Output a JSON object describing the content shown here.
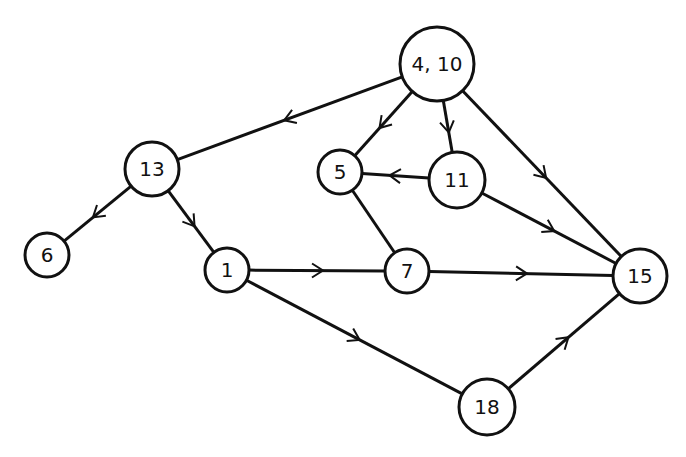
{
  "diagram": {
    "type": "directed-graph",
    "stroke_color": "#111111",
    "background": "#ffffff",
    "nodes": [
      {
        "id": "n4_10",
        "label": "4, 10",
        "x": 437,
        "y": 64,
        "r": 37
      },
      {
        "id": "n13",
        "label": "13",
        "x": 152,
        "y": 169,
        "r": 27
      },
      {
        "id": "n5",
        "label": "5",
        "x": 340,
        "y": 172,
        "r": 22
      },
      {
        "id": "n11",
        "label": "11",
        "x": 457,
        "y": 180,
        "r": 28
      },
      {
        "id": "n6",
        "label": "6",
        "x": 47,
        "y": 255,
        "r": 22
      },
      {
        "id": "n1",
        "label": "1",
        "x": 227,
        "y": 270,
        "r": 22
      },
      {
        "id": "n7",
        "label": "7",
        "x": 407,
        "y": 271,
        "r": 22
      },
      {
        "id": "n15",
        "label": "15",
        "x": 640,
        "y": 276,
        "r": 27
      },
      {
        "id": "n18",
        "label": "18",
        "x": 487,
        "y": 407,
        "r": 28
      }
    ],
    "edges": [
      {
        "from": "n4_10",
        "to": "n13",
        "directed": true
      },
      {
        "from": "n4_10",
        "to": "n5",
        "directed": true
      },
      {
        "from": "n4_10",
        "to": "n11",
        "directed": true
      },
      {
        "from": "n4_10",
        "to": "n15",
        "directed": true
      },
      {
        "from": "n11",
        "to": "n5",
        "directed": true
      },
      {
        "from": "n11",
        "to": "n15",
        "directed": true
      },
      {
        "from": "n13",
        "to": "n6",
        "directed": true
      },
      {
        "from": "n13",
        "to": "n1",
        "directed": true
      },
      {
        "from": "n5",
        "to": "n7",
        "directed": false
      },
      {
        "from": "n1",
        "to": "n7",
        "directed": true
      },
      {
        "from": "n1",
        "to": "n18",
        "directed": true
      },
      {
        "from": "n7",
        "to": "n15",
        "directed": true
      },
      {
        "from": "n18",
        "to": "n15",
        "directed": true
      }
    ]
  }
}
